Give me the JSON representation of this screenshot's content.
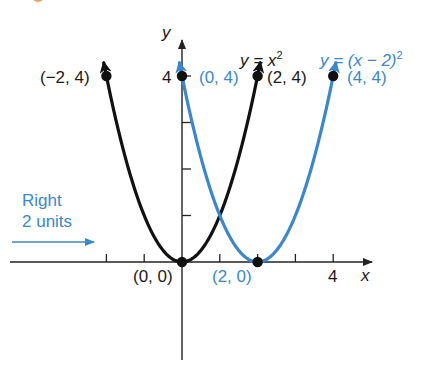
{
  "chart_data": {
    "type": "line",
    "title": "",
    "xlabel": "x",
    "ylabel": "y",
    "xlim": [
      -4.7,
      5
    ],
    "ylim": [
      -2.1,
      4.8
    ],
    "grid": false,
    "x_ticks": [
      -2,
      -1,
      1,
      2,
      3,
      4
    ],
    "x_tick_labels": {
      "4": "4"
    },
    "y_ticks": [
      1,
      2,
      3,
      4
    ],
    "y_tick_labels": {
      "4": "4"
    },
    "series": [
      {
        "name": "y = x^2",
        "color": "#111111",
        "x": [
          -2.05,
          -2,
          -1.5,
          -1,
          -0.5,
          0,
          0.5,
          1,
          1.5,
          2,
          2.05
        ],
        "y": [
          4.2,
          4,
          2.25,
          1,
          0.25,
          0,
          0.25,
          1,
          2.25,
          4,
          4.2
        ],
        "points": [
          {
            "x": -2,
            "y": 4,
            "label": "(−2, 4)"
          },
          {
            "x": 0,
            "y": 0,
            "label": "(0, 0)"
          },
          {
            "x": 2,
            "y": 4,
            "label": "(2, 4)"
          }
        ]
      },
      {
        "name": "y = (x − 2)^2",
        "color": "#3b87c8",
        "x": [
          -0.05,
          0,
          0.5,
          1,
          1.5,
          2,
          2.5,
          3,
          3.5,
          4,
          4.05
        ],
        "y": [
          4.2,
          4,
          2.25,
          1,
          0.25,
          0,
          0.25,
          1,
          2.25,
          4,
          4.2
        ],
        "points": [
          {
            "x": 0,
            "y": 4,
            "label": "(0, 4)"
          },
          {
            "x": 2,
            "y": 0,
            "label": "(2, 0)"
          },
          {
            "x": 4,
            "y": 4,
            "label": "(4, 4)"
          }
        ]
      }
    ],
    "annotations": [
      {
        "text": "Right 2 units",
        "type": "arrow",
        "direction": "right",
        "color": "#3b87c8"
      }
    ]
  },
  "labels": {
    "y_axis": "y",
    "x_axis": "x",
    "y_tick_4": "4",
    "x_tick_4": "4",
    "eq_black_prefix": "y = x",
    "eq_black_exp": "2",
    "eq_blue_prefix": "y = (x − 2)",
    "eq_blue_exp": "2",
    "pt_neg2_4": "(−2, 4)",
    "pt_0_4": "(0, 4)",
    "pt_2_4": "(2, 4)",
    "pt_4_4": "(4, 4)",
    "pt_0_0": "(0, 0)",
    "pt_2_0": "(2, 0)",
    "shift_line1": "Right",
    "shift_line2": "2 units"
  },
  "colors": {
    "axis": "#222222",
    "black_curve": "#111111",
    "blue_curve": "#3b87c8",
    "accent_corner": "#f2a05a"
  }
}
